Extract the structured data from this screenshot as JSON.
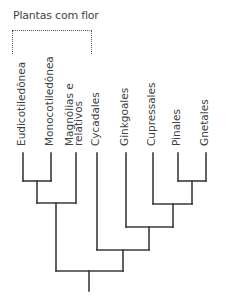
{
  "diagram": {
    "title": "Plantas com flor",
    "type": "phylogenetic-tree",
    "colors": {
      "line": "#3a3a3a",
      "text": "#3f3f3f",
      "bracket": "#555555"
    },
    "bracket": {
      "label": "Plantas com flor",
      "spans": [
        "Eudicotiledônea",
        "Monocotiledônea",
        "Magnólias e relativos"
      ]
    },
    "taxa": [
      {
        "id": "eudicot",
        "label": "Eudicotiledônea",
        "lines": [
          "Eudicotiledônea"
        ],
        "x": 23
      },
      {
        "id": "monocot",
        "label": "Monocotiledônea",
        "lines": [
          "Monocotiledônea"
        ],
        "x": 51
      },
      {
        "id": "magnolias",
        "label": "Magnólias e relativos",
        "lines": [
          "Magnólias e",
          "relativos"
        ],
        "x": 76
      },
      {
        "id": "cycadales",
        "label": "Cycadales",
        "lines": [
          "Cycadales"
        ],
        "x": 97
      },
      {
        "id": "ginkgoales",
        "label": "Ginkgoales",
        "lines": [
          "Ginkgoales"
        ],
        "x": 126
      },
      {
        "id": "cupressales",
        "label": "Cupressales",
        "lines": [
          "Cupressales"
        ],
        "x": 153
      },
      {
        "id": "pinales",
        "label": "Pinales",
        "lines": [
          "Pinales"
        ],
        "x": 178
      },
      {
        "id": "gnetales",
        "label": "Gnetales",
        "lines": [
          "Gnetales"
        ],
        "x": 206
      }
    ],
    "tip_top_y": 153,
    "label_base_y": 146,
    "clades": [
      {
        "id": "eudicot-monocot",
        "children": [
          "eudicot",
          "monocot"
        ],
        "y": 181,
        "x": 37
      },
      {
        "id": "pinales-gnetales",
        "children": [
          "pinales",
          "gnetales"
        ],
        "y": 181,
        "x": 192
      },
      {
        "id": "angiosperms",
        "children": [
          "eudicot-monocot",
          "magnolias"
        ],
        "y": 203,
        "x": 56
      },
      {
        "id": "cupressales-pg",
        "children": [
          "cupressales",
          "pinales-gnetales"
        ],
        "y": 204,
        "x": 173
      },
      {
        "id": "ginkgo-conifers",
        "children": [
          "ginkgoales",
          "cupressales-pg"
        ],
        "y": 227,
        "x": 149
      },
      {
        "id": "gymnosperms",
        "children": [
          "cycadales",
          "ginkgo-conifers"
        ],
        "y": 250,
        "x": 123
      },
      {
        "id": "root",
        "children": [
          "angiosperms",
          "gymnosperms"
        ],
        "y": 271,
        "x": 89,
        "stem_bottom": 291
      }
    ]
  }
}
